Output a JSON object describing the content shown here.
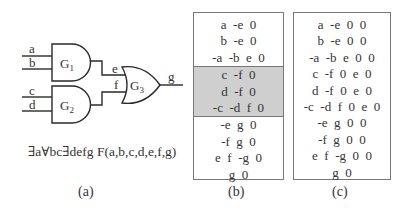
{
  "panel_a": {
    "inputs": [
      "a",
      "b",
      "c",
      "d"
    ],
    "gates": [
      {
        "label": "G",
        "sub": "1",
        "type": "AND"
      },
      {
        "label": "G",
        "sub": "2",
        "type": "AND"
      },
      {
        "label": "G",
        "sub": "3",
        "type": "OR"
      }
    ],
    "wires": [
      "e",
      "f",
      "g"
    ],
    "formula": "∃a∀bc∃defg F(a,b,c,d,e,f,g)",
    "caption": "(a)"
  },
  "panel_b": {
    "rows_top": [
      "a  -e  0",
      "b  -e  0",
      "-a  -b  e  0"
    ],
    "rows_shaded": [
      "c  -f  0",
      "d  -f  0",
      "-c  -d  f  0"
    ],
    "rows_bottom": [
      "-e  g  0",
      "-f  g  0",
      "e  f  -g  0",
      "g  0"
    ],
    "shade_color": "#cfcfcf",
    "caption": "(b)"
  },
  "panel_c": {
    "rows": [
      "a  -e  0  0",
      "b  -e  0  0",
      "-a  -b  e  0  0",
      "c  -f  0  e  0",
      "d  -f  0  e  0",
      "-c  -d  f  0  e  0",
      "-e  g  0  0",
      "-f  g  0  0",
      "e  f  -g  0  0",
      "g  0"
    ],
    "caption": "(c)"
  }
}
